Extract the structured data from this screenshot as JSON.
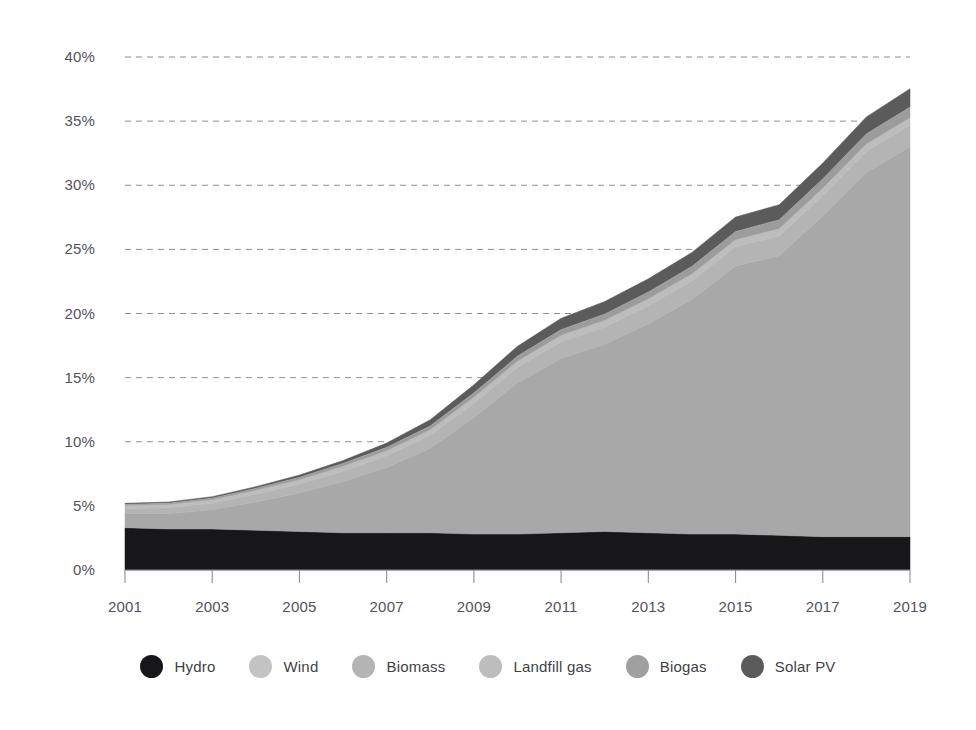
{
  "chart_data": {
    "type": "area",
    "stacked": true,
    "title": "",
    "subtitle": "",
    "xlabel": "",
    "ylabel": "",
    "xlim": [
      2001,
      2019
    ],
    "ylim": [
      0,
      40
    ],
    "y_tick_format": "percent",
    "grid": true,
    "grid_style": "dashed-horizontal",
    "legend_position": "bottom-center",
    "x": [
      2001,
      2002,
      2003,
      2004,
      2005,
      2006,
      2007,
      2008,
      2009,
      2010,
      2011,
      2012,
      2013,
      2014,
      2015,
      2016,
      2017,
      2018,
      2019
    ],
    "x_tick_labels": [
      "2001",
      "2003",
      "2005",
      "2007",
      "2009",
      "2011",
      "2013",
      "2015",
      "2017",
      "2019"
    ],
    "y_tick_labels": [
      "0%",
      "5%",
      "10%",
      "15%",
      "20%",
      "25%",
      "30%",
      "35%",
      "40%"
    ],
    "y_ticks": [
      0,
      5,
      10,
      15,
      20,
      25,
      30,
      35,
      40
    ],
    "series": [
      {
        "name": "Hydro",
        "color": "#17171a",
        "values": [
          3.3,
          3.2,
          3.2,
          3.1,
          3.0,
          2.9,
          2.9,
          2.9,
          2.8,
          2.8,
          2.9,
          3.0,
          2.9,
          2.8,
          2.8,
          2.7,
          2.6,
          2.6,
          2.6
        ]
      },
      {
        "name": "Wind",
        "color": "#a8a8a8",
        "values": [
          1.1,
          1.2,
          1.5,
          2.2,
          3.0,
          4.0,
          5.1,
          6.6,
          9.1,
          11.8,
          13.6,
          14.6,
          16.3,
          18.3,
          20.9,
          21.8,
          25.0,
          28.4,
          30.4
        ]
      },
      {
        "name": "Biomass",
        "color": "#b4b4b4",
        "values": [
          0.4,
          0.45,
          0.5,
          0.6,
          0.7,
          0.8,
          0.9,
          1.0,
          1.1,
          1.2,
          1.3,
          1.35,
          1.4,
          1.45,
          1.5,
          1.55,
          1.6,
          1.65,
          1.7
        ]
      },
      {
        "name": "Landfill gas",
        "color": "#bdbdbd",
        "values": [
          0.25,
          0.27,
          0.3,
          0.33,
          0.36,
          0.4,
          0.42,
          0.45,
          0.48,
          0.5,
          0.52,
          0.54,
          0.55,
          0.56,
          0.57,
          0.58,
          0.58,
          0.58,
          0.58
        ]
      },
      {
        "name": "Biogas",
        "color": "#9c9c9c",
        "values": [
          0.1,
          0.12,
          0.14,
          0.17,
          0.2,
          0.24,
          0.28,
          0.32,
          0.36,
          0.4,
          0.45,
          0.5,
          0.55,
          0.6,
          0.65,
          0.7,
          0.75,
          0.8,
          0.85
        ],
        "separator_above": true
      },
      {
        "name": "Solar PV",
        "color": "#5b5b5b",
        "values": [
          0.05,
          0.06,
          0.08,
          0.1,
          0.14,
          0.2,
          0.3,
          0.45,
          0.6,
          0.75,
          0.85,
          0.95,
          1.0,
          1.05,
          1.1,
          1.15,
          1.2,
          1.3,
          1.4
        ]
      }
    ],
    "totals": [
      5.2,
      5.3,
      5.72,
      6.5,
      7.4,
      8.54,
      9.9,
      11.72,
      14.44,
      17.45,
      19.62,
      20.94,
      22.7,
      24.76,
      27.52,
      28.46,
      31.73,
      35.33,
      37.53
    ]
  },
  "legend": {
    "items": [
      {
        "label": "Hydro",
        "color": "#17171a"
      },
      {
        "label": "Wind",
        "color": "#c3c3c3"
      },
      {
        "label": "Biomass",
        "color": "#b4b4b4"
      },
      {
        "label": "Landfill gas",
        "color": "#bdbdbd"
      },
      {
        "label": "Biogas",
        "color": "#a0a0a0"
      },
      {
        "label": "Solar PV",
        "color": "#5b5b5b"
      }
    ]
  },
  "axes": {
    "y_labels": [
      "40%",
      "35%",
      "30%",
      "25%",
      "20%",
      "15%",
      "10%",
      "5%",
      "0%"
    ],
    "x_labels": [
      "2001",
      "2003",
      "2005",
      "2007",
      "2009",
      "2011",
      "2013",
      "2015",
      "2017",
      "2019"
    ]
  }
}
